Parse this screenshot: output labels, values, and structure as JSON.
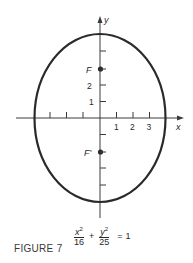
{
  "figure": {
    "caption": "FIGURE 7",
    "axes": {
      "x_label": "x",
      "y_label": "y",
      "x_tick_labels": [
        "1",
        "2",
        "3"
      ],
      "y_tick_labels": [
        "1",
        "2"
      ]
    },
    "foci": {
      "upper": "F",
      "lower": "F'"
    },
    "equation": {
      "term1_numerator": "x",
      "term1_exponent": "2",
      "term1_denominator": "16",
      "plus": "+",
      "term2_numerator": "y",
      "term2_exponent": "2",
      "term2_denominator": "25",
      "equals": "=",
      "rhs": "1"
    },
    "ellipse": {
      "a": 4,
      "b": 5,
      "c": 3,
      "stroke_color": "#2a2a2a"
    }
  }
}
